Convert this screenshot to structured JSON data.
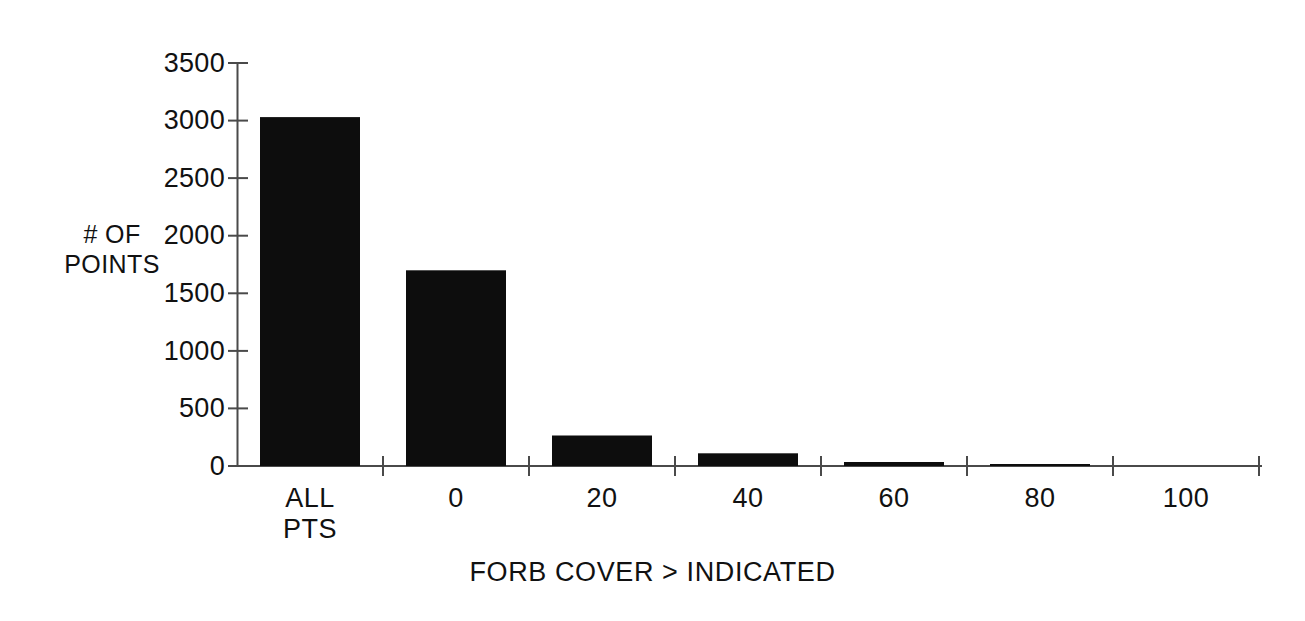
{
  "chart_data": {
    "type": "bar",
    "title": "",
    "subtitle": "",
    "xlabel": "FORB COVER > INDICATED",
    "ylabel": "# OF\nPOINTS",
    "categories": [
      "ALL\nPTS",
      "0",
      "20",
      "40",
      "60",
      "80",
      "100"
    ],
    "category_labels_flat": [
      "ALL PTS",
      "0",
      "20",
      "40",
      "60",
      "80",
      "100"
    ],
    "values": [
      3030,
      1700,
      265,
      110,
      35,
      10,
      0
    ],
    "series": [
      {
        "name": "# OF POINTS",
        "values": [
          3030,
          1700,
          265,
          110,
          35,
          10,
          0
        ]
      }
    ],
    "ylim": [
      0,
      3500
    ],
    "xlim_note": "categorical",
    "ytick_values": [
      0,
      500,
      1000,
      1500,
      2000,
      2500,
      3000,
      3500
    ],
    "ytick_labels": [
      "0",
      "500",
      "1000",
      "1500",
      "2000",
      "2500",
      "3000",
      "3500"
    ],
    "grid": false,
    "legend": false,
    "legend_position": "none",
    "bar_color": "#0d0d0d",
    "axis_color": "#4a4a4a",
    "background_color": "#ffffff",
    "tick_direction": "out-and-in",
    "x_ticks_between_categories": true
  },
  "axis": {
    "y_title": "# OF\nPOINTS",
    "x_title": "FORB COVER > INDICATED"
  },
  "y_ticks": [
    {
      "label": "3500",
      "value": 3500
    },
    {
      "label": "3000",
      "value": 3000
    },
    {
      "label": "2500",
      "value": 2500
    },
    {
      "label": "2000",
      "value": 2000
    },
    {
      "label": "1500",
      "value": 1500
    },
    {
      "label": "1000",
      "value": 1000
    },
    {
      "label": "500",
      "value": 500
    },
    {
      "label": "0",
      "value": 0
    }
  ],
  "x_ticks": [
    {
      "label": "ALL\nPTS"
    },
    {
      "label": "0"
    },
    {
      "label": "20"
    },
    {
      "label": "40"
    },
    {
      "label": "60"
    },
    {
      "label": "80"
    },
    {
      "label": "100"
    }
  ],
  "bars": [
    {
      "category": "ALL PTS",
      "value": 3030
    },
    {
      "category": "0",
      "value": 1700
    },
    {
      "category": "20",
      "value": 265
    },
    {
      "category": "40",
      "value": 110
    },
    {
      "category": "60",
      "value": 35
    },
    {
      "category": "80",
      "value": 10
    },
    {
      "category": "100",
      "value": 0
    }
  ]
}
